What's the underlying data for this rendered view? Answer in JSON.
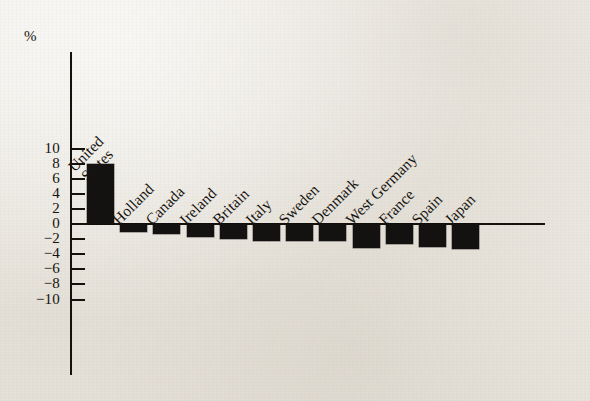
{
  "chart_data": {
    "type": "bar",
    "title": "",
    "xlabel": "",
    "ylabel": "%",
    "unit_label": "%",
    "categories": [
      "United States",
      "Holland",
      "Canada",
      "Ireland",
      "Britain",
      "Italy",
      "Sweden",
      "Denmark",
      "West Germany",
      "France",
      "Spain",
      "Japan"
    ],
    "category_lines": [
      [
        "United",
        "States"
      ],
      [
        "Holland"
      ],
      [
        "Canada"
      ],
      [
        "Ireland"
      ],
      [
        "Britain"
      ],
      [
        "Italy"
      ],
      [
        "Sweden"
      ],
      [
        "Denmark"
      ],
      [
        "West Germany"
      ],
      [
        "France"
      ],
      [
        "Spain"
      ],
      [
        "Japan"
      ]
    ],
    "values": [
      7.9,
      -1.1,
      -1.3,
      -1.7,
      -2.0,
      -2.2,
      -2.3,
      -2.3,
      -3.2,
      -2.7,
      -3.0,
      -3.3
    ],
    "ylim": [
      -10,
      10
    ],
    "yticks": [
      10,
      8,
      6,
      4,
      2,
      0,
      -2,
      -4,
      -6,
      -8,
      -10
    ],
    "ytick_labels": [
      "10",
      "8",
      "6",
      "4",
      "2",
      "0",
      "−2",
      "−4",
      "−6",
      "−8",
      "−10"
    ],
    "grid": false,
    "legend": false,
    "bar_color": "#131211",
    "axis_color": "#15120e",
    "background_color": "#efece6"
  }
}
